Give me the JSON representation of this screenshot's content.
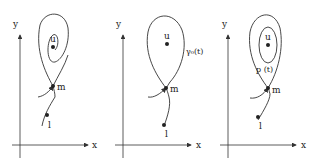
{
  "figure": {
    "panels": [
      {
        "id": "panel-1",
        "axis_labels": {
          "x": "x",
          "y": "y"
        },
        "points": {
          "u": "u",
          "m": "m",
          "l": "l"
        },
        "curve_label": ""
      },
      {
        "id": "panel-2",
        "axis_labels": {
          "x": "x",
          "y": "y"
        },
        "points": {
          "u": "u",
          "m": "m",
          "l": "l"
        },
        "curve_label": "γ₀(t)"
      },
      {
        "id": "panel-3",
        "axis_labels": {
          "x": "x",
          "y": "y"
        },
        "points": {
          "u": "u",
          "m": "m",
          "l": "l"
        },
        "curve_label": "p (t)"
      }
    ],
    "colors": {
      "ink": "#333333",
      "background": "#ffffff"
    }
  }
}
